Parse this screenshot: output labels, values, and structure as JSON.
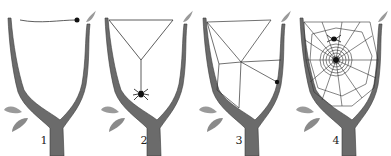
{
  "figure": {
    "colors": {
      "bark": "#6b6b6b",
      "bark_dark": "#3a3a3a",
      "leaf": "#9a9a9a",
      "silk": "#333333",
      "spider": "#111111"
    },
    "panels": [
      {
        "label": "1",
        "stage": "first bridge thread"
      },
      {
        "label": "2",
        "stage": "Y-shaped frame with spider descending"
      },
      {
        "label": "3",
        "stage": "frame and radial threads"
      },
      {
        "label": "4",
        "stage": "completed orb web with spiral"
      }
    ]
  }
}
